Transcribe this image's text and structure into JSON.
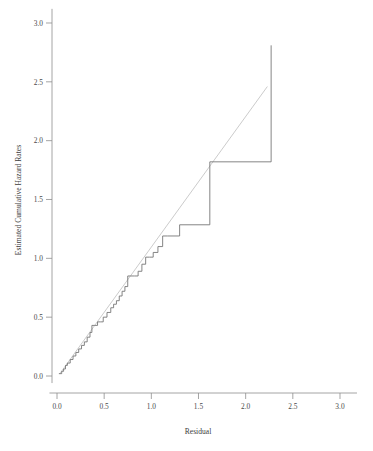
{
  "chart_data": {
    "type": "line",
    "title": "",
    "xlabel": "Residual",
    "ylabel": "Estimated Cumulative Hazard Rates",
    "xlim": [
      -0.08,
      3.18
    ],
    "ylim": [
      -0.06,
      3.12
    ],
    "xticks": [
      0.0,
      0.5,
      1.0,
      1.5,
      2.0,
      2.5,
      3.0
    ],
    "xticklabels": [
      "0.0",
      "0.5",
      "1.0",
      "1.5",
      "2.0",
      "2.5",
      "3.0"
    ],
    "yticks": [
      0.0,
      0.5,
      1.0,
      1.5,
      2.0,
      2.5,
      3.0
    ],
    "yticklabels": [
      "0.0",
      "0.5",
      "1.0",
      "1.5",
      "2.0",
      "2.5",
      "3.0"
    ],
    "grid": false,
    "legend": "none",
    "series": [
      {
        "name": "Estimated cumulative hazard (step function)",
        "drawstyle": "steps-post",
        "color": "#6f6f6f",
        "x": [
          0.02,
          0.05,
          0.07,
          0.09,
          0.11,
          0.14,
          0.17,
          0.2,
          0.23,
          0.26,
          0.29,
          0.32,
          0.35,
          0.37,
          0.4,
          0.43,
          0.46,
          0.49,
          0.53,
          0.57,
          0.6,
          0.63,
          0.66,
          0.69,
          0.72,
          0.75,
          0.78,
          0.82,
          0.86,
          0.9,
          0.94,
          0.98,
          1.02,
          1.07,
          1.12,
          1.17,
          1.3,
          1.62,
          1.62,
          2.27
        ],
        "y": [
          0.02,
          0.04,
          0.06,
          0.09,
          0.11,
          0.14,
          0.17,
          0.2,
          0.23,
          0.26,
          0.29,
          0.33,
          0.37,
          0.43,
          0.43,
          0.46,
          0.46,
          0.5,
          0.54,
          0.58,
          0.61,
          0.64,
          0.68,
          0.72,
          0.76,
          0.85,
          0.85,
          0.85,
          0.89,
          0.95,
          1.01,
          1.01,
          1.05,
          1.1,
          1.19,
          1.19,
          1.285,
          1.285,
          1.82,
          2.81
        ]
      },
      {
        "name": "Reference line",
        "drawstyle": "default",
        "color": "#c2c2c2",
        "x": [
          0.03,
          2.23
        ],
        "y": [
          0.02,
          2.46
        ]
      }
    ]
  },
  "axes": {
    "x_axis_name": "residual-axis",
    "y_axis_name": "hazard-axis"
  }
}
